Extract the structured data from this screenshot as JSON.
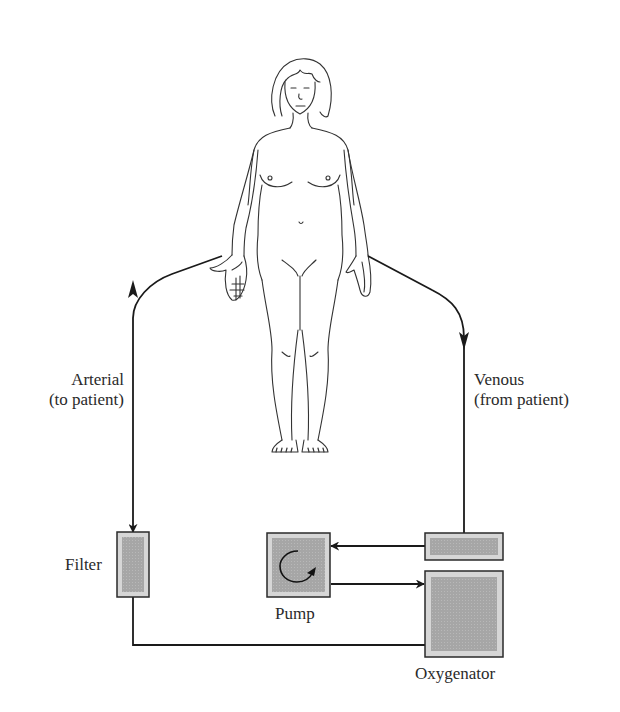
{
  "diagram": {
    "type": "circuit",
    "labels": {
      "arterial_line1": "Arterial",
      "arterial_line2": "(to patient)",
      "venous_line1": "Venous",
      "venous_line2": "(from patient)",
      "filter": "Filter",
      "pump": "Pump",
      "oxygenator": "Oxygenator"
    },
    "components": [
      {
        "id": "patient",
        "name": "Patient (human figure)"
      },
      {
        "id": "venous-reservoir",
        "name": "Venous reservoir box"
      },
      {
        "id": "pump",
        "name": "Pump",
        "icon": "circular-arrow-icon"
      },
      {
        "id": "oxygenator",
        "name": "Oxygenator"
      },
      {
        "id": "filter",
        "name": "Filter"
      }
    ],
    "flow": [
      "patient -> venous-reservoir (venous, from patient)",
      "venous-reservoir -> pump",
      "pump -> oxygenator",
      "oxygenator -> filter",
      "filter -> patient (arterial, to patient)"
    ],
    "colors": {
      "line": "#1a1a1a",
      "box_border": "#2a2a2a",
      "box_fill_outer": "#d4d4d4",
      "box_fill_inner": "#a9a9a9"
    }
  }
}
